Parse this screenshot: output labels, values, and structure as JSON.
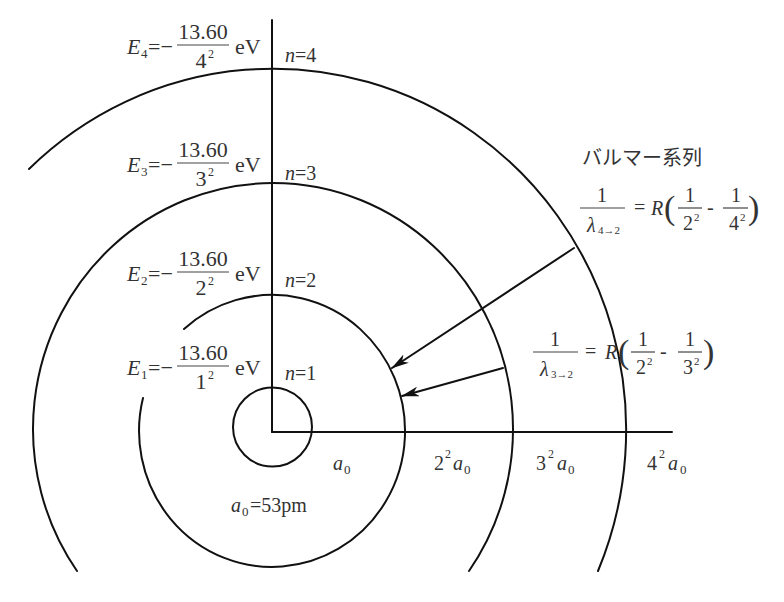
{
  "colors": {
    "line": "#111111",
    "text": "#333333",
    "background": "#ffffff"
  },
  "energy_levels": [
    {
      "E_symbol": "E",
      "E_sub": "4",
      "equals_minus": "=−",
      "numerator": "13.60",
      "den_base": "4",
      "den_exp": "2",
      "unit": "eV",
      "n_symbol": "n",
      "n_equals": "=4"
    },
    {
      "E_symbol": "E",
      "E_sub": "3",
      "equals_minus": "=−",
      "numerator": "13.60",
      "den_base": "3",
      "den_exp": "2",
      "unit": "eV",
      "n_symbol": "n",
      "n_equals": "=3"
    },
    {
      "E_symbol": "E",
      "E_sub": "2",
      "equals_minus": "=−",
      "numerator": "13.60",
      "den_base": "2",
      "den_exp": "2",
      "unit": "eV",
      "n_symbol": "n",
      "n_equals": "=2"
    },
    {
      "E_symbol": "E",
      "E_sub": "1",
      "equals_minus": "=−",
      "numerator": "13.60",
      "den_base": "1",
      "den_exp": "2",
      "unit": "eV",
      "n_symbol": "n",
      "n_equals": "=1"
    }
  ],
  "orbit_radius_labels": [
    {
      "coef": "",
      "exp": "",
      "symbol": "a",
      "sub": "0"
    },
    {
      "coef": "2",
      "exp": "2",
      "symbol": "a",
      "sub": "0"
    },
    {
      "coef": "3",
      "exp": "2",
      "symbol": "a",
      "sub": "0"
    },
    {
      "coef": "4",
      "exp": "2",
      "symbol": "a",
      "sub": "0"
    }
  ],
  "bohr_radius": {
    "symbol": "a",
    "sub": "0",
    "value": "=53pm"
  },
  "balmer_series": {
    "title": "バルマー系列",
    "formulas": [
      {
        "numerator": "1",
        "lambda": "λ",
        "transition": "4→2",
        "equals": "=",
        "constant": "R",
        "open": "(",
        "t1_num": "1",
        "t1_base": "2",
        "t1_exp": "2",
        "minus": "-",
        "t2_num": "1",
        "t2_base": "4",
        "t2_exp": "2",
        "close": ")"
      },
      {
        "numerator": "1",
        "lambda": "λ",
        "transition": "3→2",
        "equals": "=",
        "constant": "R",
        "open": "(",
        "t1_num": "1",
        "t1_base": "2",
        "t1_exp": "2",
        "minus": "-",
        "t2_num": "1",
        "t2_base": "3",
        "t2_exp": "2",
        "close": ")"
      }
    ]
  }
}
